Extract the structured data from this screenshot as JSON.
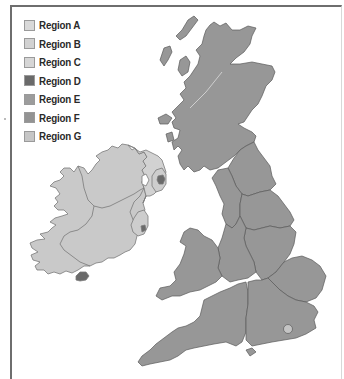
{
  "legend": {
    "items": [
      {
        "label": "Region A",
        "color": "#d9d9d9"
      },
      {
        "label": "Region B",
        "color": "#d2d2d2"
      },
      {
        "label": "Region C",
        "color": "#d6d6d6"
      },
      {
        "label": "Region D",
        "color": "#6a6a6a"
      },
      {
        "label": "Region E",
        "color": "#9c9c9c"
      },
      {
        "label": "Region F",
        "color": "#939393"
      },
      {
        "label": "Region G",
        "color": "#c6c6c6"
      }
    ]
  },
  "map": {
    "colors": {
      "ireland": "#c9c9c9",
      "ireland_border": "#7a7a7a",
      "britain": "#979797",
      "britain_border": "#5a5a5a",
      "urban": "#6a6a6a",
      "london": "#c4c4c4",
      "frame": "#6e6e6e"
    },
    "areas": [
      "Scotland",
      "North East England",
      "North West England",
      "Yorkshire",
      "West Midlands",
      "East Midlands",
      "Wales",
      "East of England",
      "South West England",
      "South East England",
      "London",
      "Northern Ireland",
      "Republic of Ireland"
    ]
  }
}
